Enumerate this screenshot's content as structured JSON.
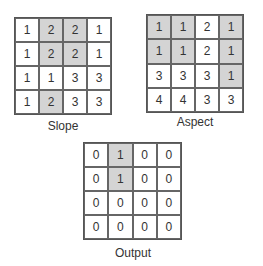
{
  "grids": {
    "slope": {
      "label": "Slope",
      "values": [
        [
          1,
          2,
          2,
          1
        ],
        [
          1,
          2,
          2,
          1
        ],
        [
          1,
          1,
          3,
          3
        ],
        [
          1,
          2,
          3,
          3
        ]
      ],
      "shaded": [
        [
          0,
          1,
          1,
          0
        ],
        [
          0,
          1,
          1,
          0
        ],
        [
          0,
          0,
          0,
          0
        ],
        [
          0,
          1,
          0,
          0
        ]
      ]
    },
    "aspect": {
      "label": "Aspect",
      "values": [
        [
          1,
          1,
          2,
          1
        ],
        [
          1,
          1,
          2,
          1
        ],
        [
          3,
          3,
          3,
          1
        ],
        [
          4,
          4,
          3,
          3
        ]
      ],
      "shaded": [
        [
          1,
          1,
          0,
          1
        ],
        [
          1,
          1,
          0,
          1
        ],
        [
          0,
          0,
          0,
          1
        ],
        [
          0,
          0,
          0,
          0
        ]
      ]
    },
    "output": {
      "label": "Output",
      "values": [
        [
          0,
          1,
          0,
          0
        ],
        [
          0,
          1,
          0,
          0
        ],
        [
          0,
          0,
          0,
          0
        ],
        [
          0,
          0,
          0,
          0
        ]
      ],
      "shaded": [
        [
          0,
          1,
          0,
          0
        ],
        [
          0,
          1,
          0,
          0
        ],
        [
          0,
          0,
          0,
          0
        ],
        [
          0,
          0,
          0,
          0
        ]
      ]
    }
  },
  "colors": {
    "shaded": "#d4d4d4",
    "unshaded": "#ffffff",
    "border": "#555555",
    "text": "#333333"
  }
}
